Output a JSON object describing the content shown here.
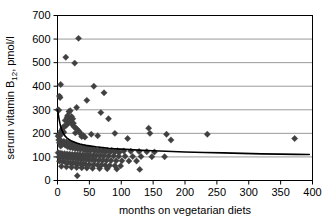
{
  "chart_data": {
    "type": "scatter",
    "title": "",
    "xlabel": "months on vegetarian diets",
    "ylabel": "serum vitamin B12, pmol/l",
    "ylabel_main": "serum vitamin B",
    "ylabel_sub": "12",
    "ylabel_tail": ", pmol/l",
    "xlim": [
      0,
      400
    ],
    "ylim": [
      0,
      700
    ],
    "xticks": [
      0,
      50,
      100,
      150,
      200,
      250,
      300,
      350,
      400
    ],
    "yticks": [
      0,
      100,
      200,
      300,
      400,
      500,
      600,
      700
    ],
    "xtick_labels": [
      "0",
      "50",
      "100",
      "150",
      "200",
      "250",
      "300",
      "350",
      "400"
    ],
    "ytick_labels": [
      "0",
      "100",
      "200",
      "300",
      "400",
      "500",
      "600",
      "700"
    ],
    "grid": "horizontal",
    "grid_color": "#808080",
    "frame_color": "#000000",
    "marker": "diamond",
    "marker_color": "#404040",
    "marker_size": 3.2,
    "legend": "none",
    "fit_curve": {
      "label": "fitted decay curve",
      "color": "#000000",
      "width": 1.6,
      "description": "decreasing power/exponential fit from ~300 at 0 months to ~110 plateau",
      "points": [
        [
          0,
          300
        ],
        [
          1,
          285
        ],
        [
          2,
          268
        ],
        [
          3,
          253
        ],
        [
          4,
          240
        ],
        [
          5,
          229
        ],
        [
          6,
          220
        ],
        [
          8,
          206
        ],
        [
          10,
          196
        ],
        [
          12,
          188
        ],
        [
          15,
          180
        ],
        [
          18,
          174
        ],
        [
          21,
          169
        ],
        [
          25,
          164
        ],
        [
          30,
          159
        ],
        [
          35,
          155
        ],
        [
          40,
          152
        ],
        [
          45,
          149
        ],
        [
          50,
          147
        ],
        [
          60,
          143
        ],
        [
          70,
          140
        ],
        [
          80,
          137
        ],
        [
          90,
          135
        ],
        [
          100,
          133
        ],
        [
          120,
          130
        ],
        [
          140,
          127
        ],
        [
          160,
          125
        ],
        [
          180,
          123
        ],
        [
          200,
          121
        ],
        [
          230,
          119
        ],
        [
          260,
          117
        ],
        [
          290,
          115
        ],
        [
          320,
          113
        ],
        [
          350,
          112
        ],
        [
          375,
          111
        ],
        [
          395,
          110
        ]
      ]
    },
    "points": [
      [
        33,
        603
      ],
      [
        13,
        523
      ],
      [
        27,
        498
      ],
      [
        5,
        407
      ],
      [
        57,
        400
      ],
      [
        73,
        372
      ],
      [
        3,
        358
      ],
      [
        4,
        352
      ],
      [
        46,
        340
      ],
      [
        30,
        310
      ],
      [
        1,
        300
      ],
      [
        2,
        298
      ],
      [
        20,
        296
      ],
      [
        18,
        293
      ],
      [
        68,
        288
      ],
      [
        16,
        276
      ],
      [
        22,
        272
      ],
      [
        15,
        268
      ],
      [
        24,
        262
      ],
      [
        19,
        258
      ],
      [
        12,
        255
      ],
      [
        21,
        250
      ],
      [
        17,
        246
      ],
      [
        25,
        243
      ],
      [
        80,
        262
      ],
      [
        23,
        238
      ],
      [
        14,
        234
      ],
      [
        11,
        231
      ],
      [
        26,
        228
      ],
      [
        9,
        226
      ],
      [
        29,
        222
      ],
      [
        8,
        220
      ],
      [
        31,
        216
      ],
      [
        7,
        213
      ],
      [
        6,
        210
      ],
      [
        34,
        208
      ],
      [
        10,
        205
      ],
      [
        28,
        202
      ],
      [
        5,
        200
      ],
      [
        36,
        198
      ],
      [
        3,
        196
      ],
      [
        2,
        193
      ],
      [
        40,
        192
      ],
      [
        4,
        190
      ],
      [
        1,
        188
      ],
      [
        38,
        186
      ],
      [
        43,
        184
      ],
      [
        53,
        196
      ],
      [
        63,
        190
      ],
      [
        90,
        200
      ],
      [
        110,
        178
      ],
      [
        143,
        222
      ],
      [
        145,
        200
      ],
      [
        171,
        196
      ],
      [
        178,
        172
      ],
      [
        235,
        196
      ],
      [
        372,
        178
      ],
      [
        2,
        172
      ],
      [
        6,
        168
      ],
      [
        10,
        166
      ],
      [
        14,
        164
      ],
      [
        3,
        160
      ],
      [
        18,
        158
      ],
      [
        22,
        156
      ],
      [
        8,
        154
      ],
      [
        26,
        152
      ],
      [
        12,
        150
      ],
      [
        30,
        148
      ],
      [
        5,
        146
      ],
      [
        34,
        145
      ],
      [
        16,
        143
      ],
      [
        38,
        142
      ],
      [
        20,
        140
      ],
      [
        42,
        139
      ],
      [
        24,
        138
      ],
      [
        46,
        137
      ],
      [
        28,
        136
      ],
      [
        50,
        135
      ],
      [
        32,
        134
      ],
      [
        55,
        133
      ],
      [
        36,
        132
      ],
      [
        60,
        131
      ],
      [
        41,
        130
      ],
      [
        66,
        130
      ],
      [
        45,
        129
      ],
      [
        72,
        129
      ],
      [
        48,
        128
      ],
      [
        78,
        128
      ],
      [
        52,
        127
      ],
      [
        85,
        127
      ],
      [
        58,
        126
      ],
      [
        94,
        126
      ],
      [
        64,
        125
      ],
      [
        104,
        125
      ],
      [
        70,
        124
      ],
      [
        115,
        124
      ],
      [
        76,
        123
      ],
      [
        128,
        123
      ],
      [
        83,
        122
      ],
      [
        140,
        122
      ],
      [
        90,
        121
      ],
      [
        152,
        121
      ],
      [
        97,
        120
      ],
      [
        1,
        118
      ],
      [
        4,
        116
      ],
      [
        7,
        115
      ],
      [
        11,
        114
      ],
      [
        15,
        113
      ],
      [
        19,
        112
      ],
      [
        23,
        111
      ],
      [
        27,
        110
      ],
      [
        31,
        110
      ],
      [
        35,
        109
      ],
      [
        39,
        108
      ],
      [
        43,
        108
      ],
      [
        47,
        107
      ],
      [
        51,
        107
      ],
      [
        56,
        106
      ],
      [
        61,
        106
      ],
      [
        67,
        105
      ],
      [
        73,
        105
      ],
      [
        80,
        104
      ],
      [
        88,
        104
      ],
      [
        96,
        103
      ],
      [
        106,
        103
      ],
      [
        118,
        102
      ],
      [
        131,
        102
      ],
      [
        148,
        101
      ],
      [
        168,
        101
      ],
      [
        2,
        100
      ],
      [
        5,
        99
      ],
      [
        9,
        98
      ],
      [
        13,
        97
      ],
      [
        17,
        96
      ],
      [
        21,
        95
      ],
      [
        25,
        94
      ],
      [
        29,
        93
      ],
      [
        33,
        92
      ],
      [
        37,
        91
      ],
      [
        41,
        90
      ],
      [
        45,
        89
      ],
      [
        49,
        88
      ],
      [
        54,
        88
      ],
      [
        59,
        87
      ],
      [
        65,
        86
      ],
      [
        71,
        86
      ],
      [
        77,
        85
      ],
      [
        84,
        85
      ],
      [
        92,
        84
      ],
      [
        101,
        84
      ],
      [
        112,
        83
      ],
      [
        124,
        83
      ],
      [
        3,
        82
      ],
      [
        8,
        80
      ],
      [
        12,
        78
      ],
      [
        16,
        76
      ],
      [
        20,
        75
      ],
      [
        24,
        74
      ],
      [
        28,
        73
      ],
      [
        32,
        72
      ],
      [
        36,
        71
      ],
      [
        40,
        70
      ],
      [
        44,
        69
      ],
      [
        50,
        68
      ],
      [
        57,
        67
      ],
      [
        63,
        66
      ],
      [
        69,
        66
      ],
      [
        75,
        65
      ],
      [
        82,
        64
      ],
      [
        90,
        63
      ],
      [
        99,
        62
      ],
      [
        6,
        60
      ],
      [
        14,
        58
      ],
      [
        22,
        56
      ],
      [
        30,
        55
      ],
      [
        38,
        54
      ],
      [
        46,
        53
      ],
      [
        55,
        52
      ],
      [
        66,
        51
      ],
      [
        78,
        50
      ],
      [
        93,
        49
      ],
      [
        129,
        47
      ],
      [
        31,
        20
      ]
    ]
  }
}
